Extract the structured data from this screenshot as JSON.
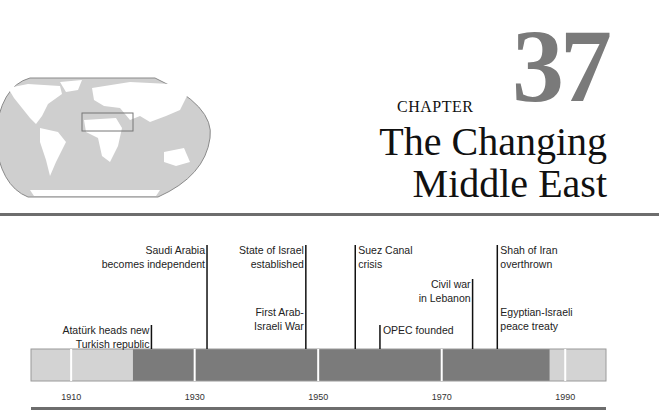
{
  "chapter": {
    "word": "CHAPTER",
    "number": "37",
    "title_lines": [
      "The Changing",
      "Middle East"
    ]
  },
  "locator_map": {
    "icon": "world-map-icon",
    "highlight_region": "Middle East",
    "colors": {
      "ocean": "#cfcfcf",
      "land": "#ffffff",
      "outline": "#8a8a8a"
    }
  },
  "timeline": {
    "range": [
      1903.5,
      1996.6
    ],
    "periods": [
      {
        "start": 1903.5,
        "end": 1920,
        "shade": "light"
      },
      {
        "start": 1920,
        "end": 1987.5,
        "shade": "dark"
      },
      {
        "start": 1987.5,
        "end": 1996.6,
        "shade": "light"
      }
    ],
    "ticks": [
      {
        "year": 1910,
        "label": "1910"
      },
      {
        "year": 1930,
        "label": "1930"
      },
      {
        "year": 1950,
        "label": "1950"
      },
      {
        "year": 1970,
        "label": "1970"
      },
      {
        "year": 1990,
        "label": "1990"
      }
    ],
    "events": [
      {
        "year": 1923,
        "side": "left",
        "level": 2,
        "lines": [
          "Atatürk heads new",
          "Turkish republic"
        ]
      },
      {
        "year": 1932,
        "side": "left",
        "level": 0,
        "lines": [
          "Saudi Arabia",
          "becomes independent"
        ]
      },
      {
        "year": 1948,
        "side": "left",
        "level": 0,
        "lines": [
          "State of Israel",
          "established"
        ]
      },
      {
        "year": 1948,
        "side": "left",
        "level": 1.55,
        "lines": [
          "First Arab-",
          "Israeli War"
        ],
        "no_line": true
      },
      {
        "year": 1956,
        "side": "right",
        "level": 0,
        "lines": [
          "Suez Canal",
          "crisis"
        ]
      },
      {
        "year": 1960,
        "side": "right",
        "level": 2,
        "lines": [
          "OPEC founded"
        ]
      },
      {
        "year": 1975,
        "side": "left",
        "level": 0.85,
        "lines": [
          "Civil war",
          "in Lebanon"
        ]
      },
      {
        "year": 1979,
        "side": "right",
        "level": 0,
        "lines": [
          "Shah of Iran",
          "overthrown"
        ]
      },
      {
        "year": 1979,
        "side": "right",
        "level": 1.55,
        "lines": [
          "Egyptian-Israeli",
          "peace treaty"
        ],
        "no_line": true
      }
    ],
    "colors": {
      "light": "#d3d3d3",
      "dark": "#7b7b7b",
      "border": "#9a9a9a",
      "line": "#111111"
    }
  }
}
